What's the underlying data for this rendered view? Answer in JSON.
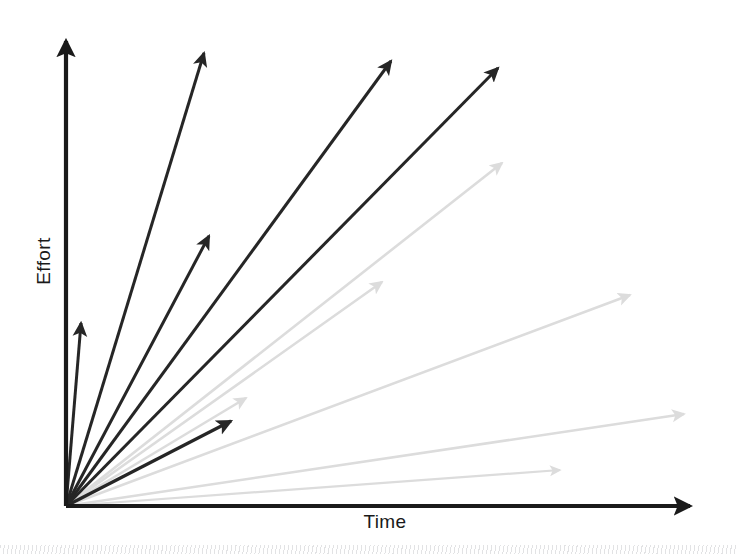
{
  "figure": {
    "background_color": "#ffffff",
    "width": 736,
    "height": 554
  },
  "axes": {
    "x_label": "Time",
    "y_label": "Effort",
    "axis_color": "#1a1a1a",
    "origin": {
      "x": 66,
      "y": 506
    },
    "x_axis_end": {
      "x": 700,
      "y": 506
    },
    "y_axis_end": {
      "x": 66,
      "y": 31
    },
    "x_has_arrowhead": true,
    "y_has_arrowhead": true
  },
  "decorations": {
    "bottom_strip_name": "scanned-page-edge-noise",
    "bottom_strip_color": "#96989e"
  },
  "chart_data": {
    "type": "scatter",
    "title": "",
    "subtitle": "",
    "xlabel": "Time",
    "ylabel": "Effort",
    "xlim": [
      0,
      700
    ],
    "ylim": [
      0,
      500
    ],
    "grid": false,
    "legend": "none",
    "annotations": [],
    "tick_labels": {
      "x": [],
      "y": []
    },
    "colors": {
      "dark": "#262626",
      "light": "#dcdcdc"
    },
    "series": [
      {
        "name": "High effort trajectories",
        "tone": "dark",
        "color": "#262626",
        "values": [
          {
            "id": "dark-1",
            "label": "steepest-short",
            "x1": 66,
            "y1": 506,
            "x2": 81,
            "y2": 323,
            "slope": 12.2,
            "length": 183,
            "width": 3.0
          },
          {
            "id": "dark-2",
            "label": "steep-long",
            "x1": 66,
            "y1": 506,
            "x2": 204,
            "y2": 53,
            "slope": 3.28,
            "length": 473,
            "width": 3.0
          },
          {
            "id": "dark-3",
            "label": "steep-mid",
            "x1": 66,
            "y1": 506,
            "x2": 209,
            "y2": 236,
            "slope": 1.89,
            "length": 305,
            "width": 3.0
          },
          {
            "id": "dark-4",
            "label": "diagonal-upper",
            "x1": 66,
            "y1": 506,
            "x2": 391,
            "y2": 61,
            "slope": 1.37,
            "length": 551,
            "width": 3.0
          },
          {
            "id": "dark-5",
            "label": "diagonal-outer",
            "x1": 66,
            "y1": 506,
            "x2": 498,
            "y2": 68,
            "slope": 1.01,
            "length": 615,
            "width": 3.0
          },
          {
            "id": "dark-6",
            "label": "shallow-short",
            "x1": 66,
            "y1": 506,
            "x2": 231,
            "y2": 421,
            "slope": 0.52,
            "length": 186,
            "width": 3.2
          }
        ]
      },
      {
        "name": "Low effort trajectories",
        "tone": "light",
        "color": "#dcdcdc",
        "values": [
          {
            "id": "light-1",
            "label": "gray-steepest",
            "x1": 66,
            "y1": 506,
            "x2": 246,
            "y2": 398,
            "slope": 0.6,
            "length": 210,
            "width": 2.6
          },
          {
            "id": "light-2",
            "label": "gray-upper",
            "x1": 66,
            "y1": 506,
            "x2": 502,
            "y2": 163,
            "slope": 0.79,
            "length": 555,
            "width": 2.6
          },
          {
            "id": "light-3",
            "label": "gray-mid",
            "x1": 66,
            "y1": 506,
            "x2": 382,
            "y2": 282,
            "slope": 0.71,
            "length": 387,
            "width": 2.6
          },
          {
            "id": "light-4",
            "label": "gray-lower",
            "x1": 66,
            "y1": 506,
            "x2": 630,
            "y2": 295,
            "slope": 0.37,
            "length": 602,
            "width": 2.6
          },
          {
            "id": "light-5",
            "label": "gray-lowest",
            "x1": 66,
            "y1": 506,
            "x2": 684,
            "y2": 414,
            "slope": 0.15,
            "length": 625,
            "width": 2.6
          },
          {
            "id": "light-6",
            "label": "gray-flattest",
            "x1": 66,
            "y1": 506,
            "x2": 560,
            "y2": 470,
            "slope": 0.07,
            "length": 495,
            "width": 2.2
          }
        ]
      }
    ]
  }
}
